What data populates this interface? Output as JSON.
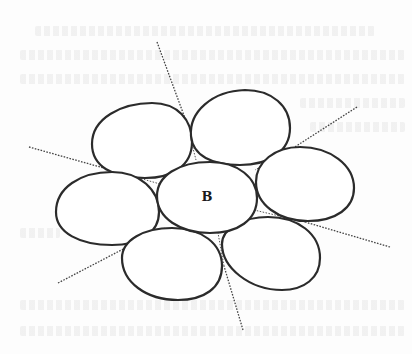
{
  "figure": {
    "center_label": "B",
    "colors": {
      "background": "#fdfdfd",
      "outline": "#2b2b2b",
      "tangent_line": "#444444"
    },
    "cells": [
      {
        "name": "top-left",
        "cx": 141,
        "cy": 140,
        "rx": 51,
        "ry": 38,
        "rotate": -8
      },
      {
        "name": "top-right",
        "cx": 240,
        "cy": 127,
        "rx": 50,
        "ry": 37,
        "rotate": 5
      },
      {
        "name": "left",
        "cx": 107,
        "cy": 208,
        "rx": 52,
        "ry": 37,
        "rotate": -6
      },
      {
        "name": "center",
        "cx": 207,
        "cy": 197,
        "rx": 50,
        "ry": 36,
        "rotate": 0
      },
      {
        "name": "right",
        "cx": 304,
        "cy": 184,
        "rx": 50,
        "ry": 37,
        "rotate": 8
      },
      {
        "name": "bottom-left",
        "cx": 172,
        "cy": 264,
        "rx": 50,
        "ry": 36,
        "rotate": 6
      },
      {
        "name": "bottom-right",
        "cx": 271,
        "cy": 253,
        "rx": 49,
        "ry": 37,
        "rotate": 10
      }
    ],
    "tangent_lines": [
      {
        "name": "top",
        "x1": 157,
        "y1": 42,
        "x2": 186,
        "y2": 121
      },
      {
        "name": "top-right",
        "x1": 357,
        "y1": 107,
        "x2": 287,
        "y2": 152
      },
      {
        "name": "left",
        "x1": 29,
        "y1": 147,
        "x2": 118,
        "y2": 172
      },
      {
        "name": "right-bottom",
        "x1": 390,
        "y1": 247,
        "x2": 305,
        "y2": 222
      },
      {
        "name": "bottom-left",
        "x1": 58,
        "y1": 283,
        "x2": 131,
        "y2": 245
      },
      {
        "name": "bottom",
        "x1": 243,
        "y1": 330,
        "x2": 224,
        "y2": 266
      }
    ]
  }
}
